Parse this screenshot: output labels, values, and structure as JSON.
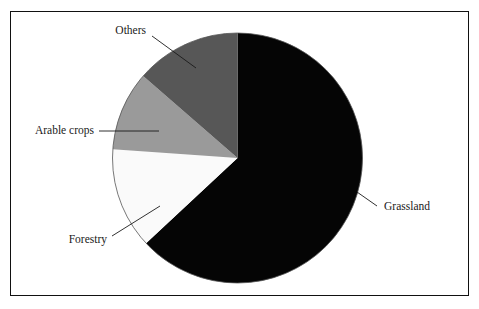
{
  "figure": {
    "background_color": "#ffffff",
    "frame_color": "#111111",
    "has_frame": true
  },
  "chart_data": {
    "type": "pie",
    "title": "",
    "subtitle": "",
    "xlabel": "",
    "ylabel": "",
    "legend_position": "none",
    "labels_position": "outside-with-leader-lines",
    "start_angle_deg": 0,
    "direction": "clockwise",
    "categories": [
      "Grassland",
      "Forestry",
      "Arable crops",
      "Others"
    ],
    "values": [
      63,
      13,
      10,
      14
    ],
    "units": "percent",
    "slices": [
      {
        "label": "Grassland",
        "value": 63,
        "color": "#050505",
        "start_deg": 0,
        "end_deg": 227,
        "label_x": 384,
        "label_y": 207,
        "label_anchor": "start",
        "leader": "M 357 192 L 377 206"
      },
      {
        "label": "Forestry",
        "value": 13,
        "color": "#fafafa",
        "start_deg": 227,
        "end_deg": 274,
        "label_x": 107,
        "label_y": 240,
        "label_anchor": "end",
        "leader": "M 160 206 L 112 236"
      },
      {
        "label": "Arable crops",
        "value": 10,
        "color": "#9a9a9a",
        "start_deg": 274,
        "end_deg": 311,
        "label_x": 94,
        "label_y": 131,
        "label_anchor": "end",
        "leader": "M 159 131 L 99 131"
      },
      {
        "label": "Others",
        "value": 14,
        "color": "#575757",
        "start_deg": 311,
        "end_deg": 360,
        "label_x": 146,
        "label_y": 31,
        "label_anchor": "end",
        "leader": "M 196 68 L 152 36"
      }
    ],
    "geometry": {
      "center_x": 237.5,
      "center_y": 158,
      "radius": 125
    }
  },
  "labels": {
    "grassland": "Grassland",
    "forestry": "Forestry",
    "arable_crops": "Arable crops",
    "others": "Others"
  }
}
